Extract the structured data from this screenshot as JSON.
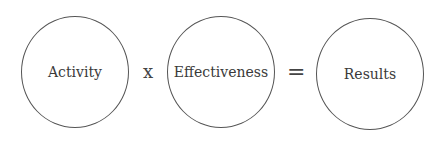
{
  "equation": {
    "terms": [
      {
        "label": "Activity"
      },
      {
        "label": "Effectiveness"
      },
      {
        "label": "Results"
      }
    ],
    "operators": {
      "multiply": "x",
      "equals": "="
    }
  }
}
